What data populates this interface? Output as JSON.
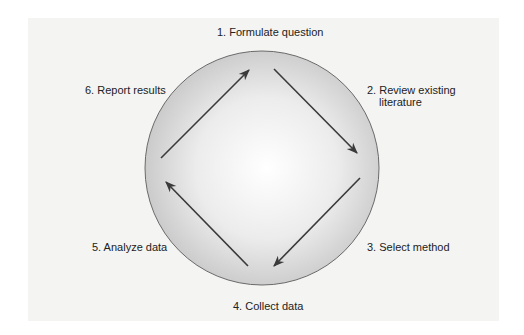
{
  "diagram": {
    "type": "cycle",
    "steps": [
      {
        "id": 1,
        "label": "1. Formulate question"
      },
      {
        "id": 2,
        "label_line1": "2. Review existing",
        "label_line2": "literature"
      },
      {
        "id": 3,
        "label": "3. Select method"
      },
      {
        "id": 4,
        "label": "4. Collect data"
      },
      {
        "id": 5,
        "label": "5. Analyze data"
      },
      {
        "id": 6,
        "label": "6. Report results"
      }
    ],
    "colors": {
      "background": "#f4f4f2",
      "circle_center": "#ffffff",
      "circle_edge": "#c8c8c8",
      "circle_stroke": "#6a6a6a",
      "arrow": "#3a3a3a"
    }
  }
}
